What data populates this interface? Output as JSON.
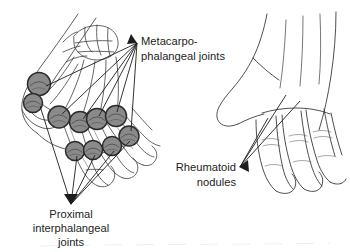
{
  "figure": {
    "background_color": "#ffffff",
    "line_color": "#3a3a3a",
    "nodule_fill": "#8a8a8a",
    "nodule_stroke": "#2b2b2b",
    "text_color": "#1d1d1d"
  },
  "labels": {
    "mcp": {
      "line1": "Metacarpo-",
      "line2": "phalangeal joints",
      "x": 141,
      "y": 45,
      "anchor": "start",
      "arrow_tip_x": 137,
      "arrow_tip_y": 43
    },
    "pip": {
      "line1": "Proximal",
      "line2": "interphalangeal",
      "line3": "joints",
      "x": 71,
      "y": 215,
      "anchor": "middle",
      "arrow_tip_x": 71,
      "arrow_tip_y": 204
    },
    "nodules": {
      "line1": "Rheumatoid",
      "line2": "nodules",
      "x": 236,
      "y": 171,
      "anchor": "end",
      "arrow_tip_x": 240,
      "arrow_tip_y": 167
    }
  },
  "panels": {
    "left": {
      "name": "schematic-skeletal-hand",
      "description": "outline hand with carpal bones and joint nodules"
    },
    "right": {
      "name": "line-drawn-hand",
      "description": "realistic contour drawing of hand dorsum with fingers"
    }
  },
  "nodules": [
    {
      "id": "mcp-thumb",
      "cx": 39,
      "cy": 84,
      "r": 11.5,
      "group": "mcp"
    },
    {
      "id": "mcp-thumb2",
      "cx": 33,
      "cy": 103,
      "r": 9.5,
      "group": "mcp"
    },
    {
      "id": "mcp-index",
      "cx": 59,
      "cy": 117,
      "r": 11.0,
      "group": "mcp"
    },
    {
      "id": "mcp-middle",
      "cx": 80,
      "cy": 122,
      "r": 10.5,
      "group": "mcp"
    },
    {
      "id": "mcp-ring",
      "cx": 97,
      "cy": 119,
      "r": 10.5,
      "group": "mcp"
    },
    {
      "id": "mcp-little",
      "cx": 116,
      "cy": 116,
      "r": 10.5,
      "group": "mcp"
    },
    {
      "id": "pip-extra",
      "cx": 129,
      "cy": 136,
      "r": 10.0,
      "group": "pip"
    },
    {
      "id": "pip-index",
      "cx": 75,
      "cy": 151,
      "r": 9.5,
      "group": "pip"
    },
    {
      "id": "pip-middle",
      "cx": 93,
      "cy": 150,
      "r": 9.5,
      "group": "pip"
    },
    {
      "id": "pip-ring",
      "cx": 112,
      "cy": 146,
      "r": 9.5,
      "group": "pip"
    }
  ],
  "arrows": {
    "mcp_targets": [
      {
        "x": 46,
        "y": 86
      },
      {
        "x": 62,
        "y": 114
      },
      {
        "x": 83,
        "y": 119
      },
      {
        "x": 99,
        "y": 116
      },
      {
        "x": 117,
        "y": 112
      },
      {
        "x": 131,
        "y": 131
      }
    ],
    "pip_targets": [
      {
        "x": 40,
        "y": 106
      },
      {
        "x": 77,
        "y": 156
      },
      {
        "x": 95,
        "y": 155
      },
      {
        "x": 114,
        "y": 151
      },
      {
        "x": 130,
        "y": 141
      }
    ],
    "nodule_targets": [
      {
        "x": 286,
        "y": 95
      },
      {
        "x": 300,
        "y": 101
      },
      {
        "x": 268,
        "y": 118
      }
    ]
  }
}
